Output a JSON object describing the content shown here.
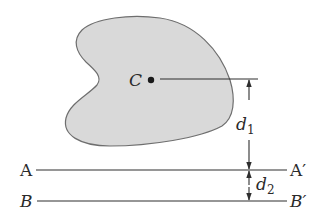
{
  "figure": {
    "colors": {
      "shape_fill": "#d9d9d9",
      "shape_stroke": "#6e6e6e",
      "line": "#2e2e2e",
      "text": "#2a2a2a"
    },
    "centroid": {
      "label": "C"
    },
    "axes": [
      {
        "name": "AA'",
        "left_label": "A",
        "right_label": "A′"
      },
      {
        "name": "BB'",
        "left_label": "B",
        "right_label": "B′"
      }
    ],
    "dimensions": [
      {
        "label": "d",
        "subscript": "1",
        "from": "C",
        "to": "AA'"
      },
      {
        "label": "d",
        "subscript": "2",
        "from": "AA'",
        "to": "BB'"
      }
    ]
  }
}
